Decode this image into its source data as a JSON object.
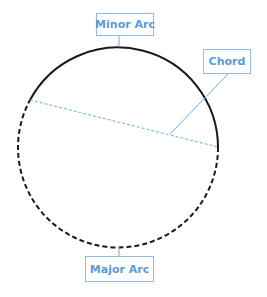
{
  "diagram": {
    "type": "circle-parts",
    "labels": {
      "minor_arc": "Minor Arc",
      "chord": "Chord",
      "major_arc": "Major Arc"
    },
    "colors": {
      "label_text": "#5b9bd8",
      "label_border": "#8fbde8",
      "chord_line": "#6aaee8",
      "leader_line": "#6aaee8",
      "arc_stroke": "#1a1a1a"
    },
    "geometry": {
      "center": [
        119,
        147
      ],
      "radius": 100,
      "chord_endpoints": [
        [
          30,
          100
        ],
        [
          218,
          147
        ]
      ],
      "minor_arc_style": "solid",
      "major_arc_style": "dashed"
    }
  }
}
